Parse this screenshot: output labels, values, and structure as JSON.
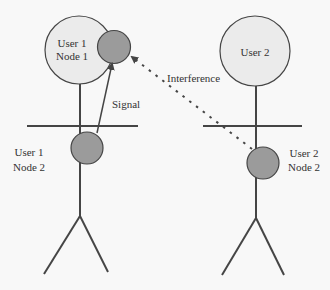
{
  "diagram": {
    "colors": {
      "background": "#f8f8f8",
      "head_fill": "#ebebeb",
      "node_fill": "#9b9b9b",
      "stroke": "#454545",
      "text": "#333333"
    },
    "users": [
      {
        "id": "user1",
        "head_label_line1": "User 1",
        "head_label_line2": "Node 1",
        "body_label_line1": "User 1",
        "body_label_line2": "Node 2"
      },
      {
        "id": "user2",
        "head_label": "User 2",
        "body_label_line1": "User 2",
        "body_label_line2": "Node 2"
      }
    ],
    "links": [
      {
        "label": "Signal",
        "style": "solid",
        "from": "User 1 Node 2",
        "to": "User 1 Node 1"
      },
      {
        "label": "Interference",
        "style": "dotted",
        "from": "User 2 Node 2",
        "to": "User 1 Node 1"
      }
    ]
  }
}
